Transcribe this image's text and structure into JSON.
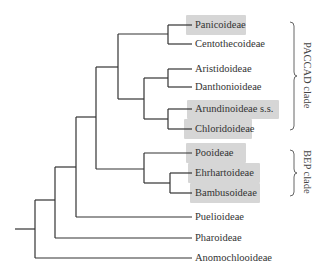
{
  "diagram": {
    "type": "phylogenetic-tree",
    "line_color": "#333333",
    "highlight_color": "#cfcfcf",
    "leaves": [
      {
        "label": "Panicoideae",
        "y": 25,
        "highlighted": true
      },
      {
        "label": "Centothecoideae",
        "y": 44,
        "highlighted": false
      },
      {
        "label": "Aristidoideae",
        "y": 69,
        "highlighted": false
      },
      {
        "label": "Danthonioideae",
        "y": 87,
        "highlighted": false
      },
      {
        "label": "Arundinoideae s.s.",
        "y": 109,
        "highlighted": true
      },
      {
        "label": "Chloridoideae",
        "y": 129,
        "highlighted": true
      },
      {
        "label": "Pooideae",
        "y": 153,
        "highlighted": true
      },
      {
        "label": "Ehrhartoideae",
        "y": 173,
        "highlighted": true
      },
      {
        "label": "Bambusoideae",
        "y": 193,
        "highlighted": true
      },
      {
        "label": "Puelioideae",
        "y": 217,
        "highlighted": false
      },
      {
        "label": "Pharoideae",
        "y": 238,
        "highlighted": false
      },
      {
        "label": "Anomochlooideae",
        "y": 258,
        "highlighted": false
      }
    ],
    "clades": [
      {
        "label": "PACCAD clade",
        "y_top": 22,
        "y_bottom": 130
      },
      {
        "label": "BEP clade",
        "y_top": 150,
        "y_bottom": 196
      }
    ],
    "topology": "(((((Panicoideae,Centothecoideae),((Aristidoideae,Danthonioideae),(Arundinoideae s.s.,Chloridoideae))),(Pooideae,(Ehrhartoideae,Bambusoideae))),Puelioideae),Pharoideae),Anomochlooideae"
  }
}
